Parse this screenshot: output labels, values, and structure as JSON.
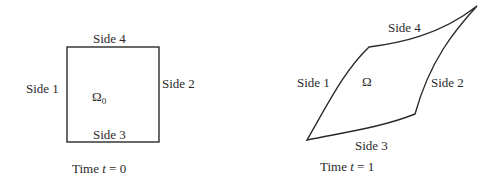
{
  "left_panel": {
    "domain_symbol": "Ω",
    "domain_subscript": "0",
    "sides": {
      "side1": "Side 1",
      "side2": "Side 2",
      "side3": "Side 3",
      "side4": "Side 4"
    },
    "caption_prefix": "Time ",
    "caption_var": "t",
    "caption_suffix": " = 0"
  },
  "right_panel": {
    "domain_symbol": "Ω",
    "sides": {
      "side1": "Side 1",
      "side2": "Side 2",
      "side3": "Side 3",
      "side4": "Side 4"
    },
    "caption_prefix": "Time ",
    "caption_var": "t",
    "caption_suffix": " = 1"
  },
  "colors": {
    "stroke": "#2a2a2a",
    "background": "#ffffff"
  }
}
